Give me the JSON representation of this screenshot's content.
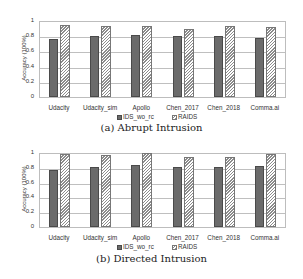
{
  "chart_data": [
    {
      "type": "bar",
      "title": "(a) Abrupt Intrusion",
      "xlabel": "",
      "ylabel": "Accuracy (100%)",
      "ylim": [
        0,
        1
      ],
      "yticks": [
        "0",
        "0.2",
        "0.4",
        "0.6",
        "0.8",
        "1"
      ],
      "grid": true,
      "legend_position": "bottom",
      "categories": [
        "Udacity",
        "Udacity_sim",
        "Apollo",
        "Chen_2017",
        "Chen_2018",
        "Comma.ai"
      ],
      "series": [
        {
          "name": "IDS_wo_rc",
          "values": [
            0.76,
            0.8,
            0.81,
            0.8,
            0.8,
            0.77
          ]
        },
        {
          "name": "RAIDS",
          "values": [
            0.95,
            0.94,
            0.94,
            0.89,
            0.93,
            0.92
          ]
        }
      ]
    },
    {
      "type": "bar",
      "title": "(b) Directed Intrusion",
      "xlabel": "",
      "ylabel": "Accuracy (100%)",
      "ylim": [
        0,
        1
      ],
      "yticks": [
        "0",
        "0.2",
        "0.4",
        "0.6",
        "0.8",
        "1"
      ],
      "grid": true,
      "legend_position": "bottom",
      "categories": [
        "Udacity",
        "Udacity_sim",
        "Apollo",
        "Chen_2017",
        "Chen_2018",
        "Comma.ai"
      ],
      "series": [
        {
          "name": "IDS_wo_rc",
          "values": [
            0.77,
            0.81,
            0.84,
            0.81,
            0.81,
            0.82
          ]
        },
        {
          "name": "RAIDS",
          "values": [
            0.99,
            0.97,
            1.0,
            0.95,
            0.95,
            0.99
          ]
        }
      ]
    }
  ],
  "colors": {
    "ids_wo_rc": "#6b6b6b",
    "raids_hatch": "#8c8c8c",
    "grid": "#bfbfbf"
  }
}
